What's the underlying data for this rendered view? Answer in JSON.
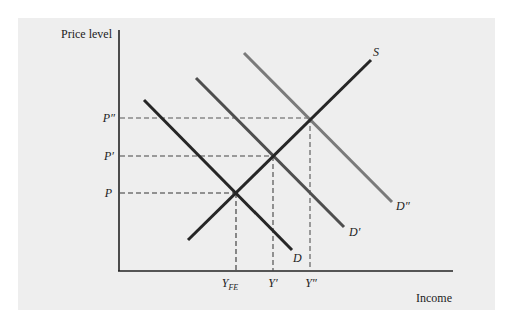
{
  "diagram": {
    "type": "aggregate supply and demand",
    "axes": {
      "y_label": "Price level",
      "x_label": "Income"
    },
    "curves": [
      {
        "name": "S",
        "label": "S",
        "kind": "supply",
        "color": "#262626"
      },
      {
        "name": "D",
        "label": "D",
        "kind": "demand",
        "color": "#262626"
      },
      {
        "name": "D'",
        "label": "D′",
        "kind": "demand",
        "color": "#4e4e4e"
      },
      {
        "name": "D''",
        "label": "D″",
        "kind": "demand",
        "color": "#7a7a7a"
      }
    ],
    "price_levels": [
      {
        "label": "P",
        "level": 1
      },
      {
        "label": "P′",
        "level": 2
      },
      {
        "label": "P″",
        "level": 3
      }
    ],
    "income_levels": [
      {
        "label": "Y",
        "subscript": "FE",
        "level": 1
      },
      {
        "label": "Y′",
        "subscript": "",
        "level": 2
      },
      {
        "label": "Y″",
        "subscript": "",
        "level": 3
      }
    ],
    "equilibria": [
      {
        "curves": [
          "S",
          "D"
        ],
        "price": "P",
        "income": "Y_FE"
      },
      {
        "curves": [
          "S",
          "D'"
        ],
        "price": "P'",
        "income": "Y'"
      },
      {
        "curves": [
          "S",
          "D''"
        ],
        "price": "P''",
        "income": "Y''"
      }
    ]
  },
  "colors": {
    "background": "#eeeeee",
    "axis": "#222222",
    "dashed": "#444444"
  }
}
